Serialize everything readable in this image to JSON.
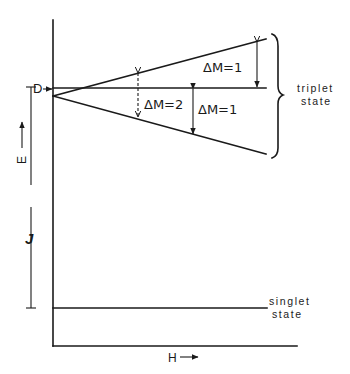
{
  "diagram": {
    "axes": {
      "x_label": "H",
      "y_label": "E",
      "x_arrow": "→",
      "y_arrow": "↑"
    },
    "zero_field_splitting_label": "D",
    "exchange_gap_label": "J",
    "transitions": [
      {
        "label": "ΔM = 1",
        "text": "ΔM=1",
        "style": "solid",
        "between": "upper-to-middle"
      },
      {
        "label": "ΔM = 2",
        "text": "ΔM=2",
        "style": "dashed",
        "between": "upper-to-lower"
      },
      {
        "label": "ΔM = 1",
        "text": "ΔM=1",
        "style": "solid",
        "between": "middle-to-lower"
      }
    ],
    "states": {
      "triplet": {
        "line1": "triplet",
        "line2": "state"
      },
      "singlet": {
        "line1": "singlet",
        "line2": "state"
      }
    },
    "colors": {
      "ink": "#1a1a1a",
      "background": "#ffffff"
    }
  }
}
